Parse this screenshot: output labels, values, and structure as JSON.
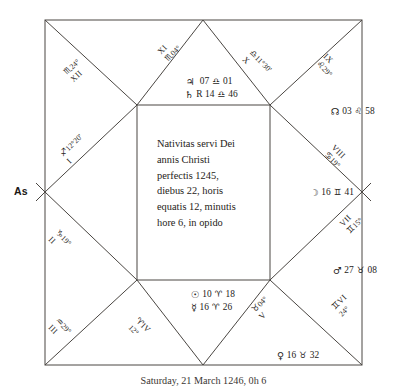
{
  "chart": {
    "ascendant_label": "As",
    "center_inscription": [
      "Nativitas servi Dei",
      "annis Christi",
      "perfectis 1245,",
      "diebus 22, horis",
      "equatis 12, minutis",
      "hore 6, in opido"
    ],
    "caption": "Saturday, 21 March 1246, 0h 6",
    "ink_color": "#221f1d",
    "line_color": "#4a4642"
  },
  "houses": [
    {
      "roman": "I",
      "sign_glyph": "♐",
      "sign_name": "sagittarius",
      "degrees": "12°20'"
    },
    {
      "roman": "II",
      "sign_glyph": "♑",
      "sign_name": "capricorn",
      "degrees": "19°"
    },
    {
      "roman": "III",
      "sign_glyph": "♒",
      "sign_name": "aquarius",
      "degrees": "29°"
    },
    {
      "roman": "IV",
      "sign_glyph": "♈",
      "sign_name": "aries",
      "degrees": "12°"
    },
    {
      "roman": "V",
      "sign_glyph": "♉",
      "sign_name": "taurus",
      "degrees": "04°"
    },
    {
      "roman": "VI",
      "sign_glyph": "♊",
      "sign_name": "gemini",
      "degrees": "24°"
    },
    {
      "roman": "VII",
      "sign_glyph": "♊",
      "sign_name": "gemini",
      "degrees": "15°"
    },
    {
      "roman": "VIII",
      "sign_glyph": "♋",
      "sign_name": "cancer",
      "degrees": "19°"
    },
    {
      "roman": "IX",
      "sign_glyph": "♌",
      "sign_name": "leo",
      "degrees": "29°"
    },
    {
      "roman": "X",
      "sign_glyph": "♎",
      "sign_name": "libra",
      "degrees": "11°30'"
    },
    {
      "roman": "XI",
      "sign_glyph": "♏",
      "sign_name": "scorpio",
      "degrees": "04°"
    },
    {
      "roman": "XII",
      "sign_glyph": "♏",
      "sign_name": "scorpio",
      "degrees": "24°"
    }
  ],
  "planets": {
    "jupiter": {
      "name": "Jupiter",
      "glyph": "♃",
      "degree": "07",
      "sign_glyph": "♎",
      "sign_name": "libra",
      "minute": "01",
      "retrograde": ""
    },
    "saturn": {
      "name": "Saturn",
      "glyph": "♄",
      "degree": "14",
      "sign_glyph": "♎",
      "sign_name": "libra",
      "minute": "46",
      "retrograde": "R"
    },
    "north_node": {
      "name": "North Node",
      "glyph": "☊",
      "degree": "03",
      "sign_glyph": "♌",
      "sign_name": "leo",
      "minute": "58",
      "retrograde": ""
    },
    "moon": {
      "name": "Moon",
      "glyph": "☽",
      "degree": "16",
      "sign_glyph": "♊",
      "sign_name": "gemini",
      "minute": "41",
      "retrograde": ""
    },
    "mars": {
      "name": "Mars",
      "glyph": "♂",
      "degree": "27",
      "sign_glyph": "♉",
      "sign_name": "taurus",
      "minute": "08",
      "retrograde": ""
    },
    "venus": {
      "name": "Venus",
      "glyph": "♀",
      "degree": "16",
      "sign_glyph": "♉",
      "sign_name": "taurus",
      "minute": "32",
      "retrograde": ""
    },
    "sun": {
      "name": "Sun",
      "glyph": "☉",
      "degree": "10",
      "sign_glyph": "♈",
      "sign_name": "aries",
      "minute": "18",
      "retrograde": ""
    },
    "mercury": {
      "name": "Mercury",
      "glyph": "☿",
      "degree": "16",
      "sign_glyph": "♈",
      "sign_name": "aries",
      "minute": "26",
      "retrograde": ""
    }
  }
}
